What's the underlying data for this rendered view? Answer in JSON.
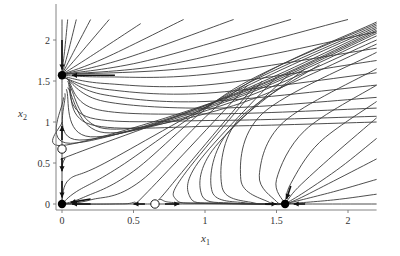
{
  "chart_data": {
    "type": "line",
    "title": "",
    "xlabel": "x1",
    "ylabel": "x2",
    "xlim": [
      0,
      2.2
    ],
    "ylim": [
      0,
      2.25
    ],
    "x_ticks": [
      0,
      0.5,
      1,
      1.5,
      2
    ],
    "x_tick_labels": [
      "0",
      "0.5",
      "1",
      "1.5",
      "2"
    ],
    "y_ticks": [
      0,
      0.5,
      1,
      1.5,
      2
    ],
    "y_tick_labels": [
      "0",
      "0.5",
      "1",
      "1.5",
      "2"
    ],
    "grid": false,
    "equilibria": [
      {
        "x": 0,
        "y": 0,
        "type": "stable",
        "filled": true
      },
      {
        "x": 0,
        "y": 1.57,
        "type": "stable",
        "filled": true
      },
      {
        "x": 0,
        "y": 0.67,
        "type": "unstable",
        "filled": false
      },
      {
        "x": 0.65,
        "y": 0,
        "type": "unstable",
        "filled": false
      },
      {
        "x": 1.56,
        "y": 0,
        "type": "stable",
        "filled": true
      }
    ],
    "arrows": [
      {
        "from": [
          0,
          2.0
        ],
        "to": [
          0,
          1.64
        ]
      },
      {
        "from": [
          0.37,
          1.57
        ],
        "to": [
          0.07,
          1.57
        ]
      },
      {
        "from": [
          0,
          0.78
        ],
        "to": [
          0,
          0.95
        ]
      },
      {
        "from": [
          0,
          0.56
        ],
        "to": [
          0,
          0.4
        ]
      },
      {
        "from": [
          0,
          0.28
        ],
        "to": [
          0,
          0.08
        ]
      },
      {
        "from": [
          0.2,
          0.06
        ],
        "to": [
          0.06,
          0.02
        ]
      },
      {
        "from": [
          0.2,
          0
        ],
        "to": [
          0.07,
          0
        ]
      },
      {
        "from": [
          0.58,
          0
        ],
        "to": [
          0.5,
          0
        ]
      },
      {
        "from": [
          0.72,
          0
        ],
        "to": [
          0.82,
          0
        ]
      },
      {
        "from": [
          1.42,
          0
        ],
        "to": [
          1.5,
          0
        ]
      },
      {
        "from": [
          1.7,
          0
        ],
        "to": [
          1.62,
          0
        ]
      },
      {
        "from": [
          1.6,
          0.22
        ],
        "to": [
          1.57,
          0.06
        ]
      }
    ],
    "trajectories": [
      [
        [
          0.04,
          2.25
        ],
        [
          0.02,
          1.9
        ],
        [
          0.0,
          1.6
        ]
      ],
      [
        [
          0.1,
          2.25
        ],
        [
          0.05,
          1.9
        ],
        [
          0.0,
          1.58
        ]
      ],
      [
        [
          0.2,
          2.25
        ],
        [
          0.08,
          1.85
        ],
        [
          0.0,
          1.58
        ]
      ],
      [
        [
          0.33,
          2.25
        ],
        [
          0.12,
          1.82
        ],
        [
          0.0,
          1.58
        ]
      ],
      [
        [
          0.55,
          2.2
        ],
        [
          0.2,
          1.8
        ],
        [
          0.0,
          1.58
        ]
      ],
      [
        [
          0.85,
          2.25
        ],
        [
          0.3,
          1.78
        ],
        [
          0.0,
          1.58
        ]
      ],
      [
        [
          1.2,
          2.25
        ],
        [
          0.45,
          1.78
        ],
        [
          0.0,
          1.58
        ]
      ],
      [
        [
          1.6,
          2.25
        ],
        [
          0.6,
          1.75
        ],
        [
          0.0,
          1.58
        ]
      ],
      [
        [
          2.0,
          2.25
        ],
        [
          0.8,
          1.72
        ],
        [
          0.0,
          1.58
        ]
      ],
      [
        [
          2.2,
          2.1
        ],
        [
          1.0,
          1.68
        ],
        [
          0.0,
          1.58
        ]
      ],
      [
        [
          2.2,
          1.9
        ],
        [
          1.0,
          1.58
        ],
        [
          0.3,
          1.55
        ],
        [
          0.0,
          1.57
        ]
      ],
      [
        [
          2.2,
          1.75
        ],
        [
          1.0,
          1.45
        ],
        [
          0.3,
          1.47
        ],
        [
          0.0,
          1.56
        ]
      ],
      [
        [
          2.2,
          1.6
        ],
        [
          1.0,
          1.35
        ],
        [
          0.3,
          1.4
        ],
        [
          0.0,
          1.55
        ]
      ],
      [
        [
          2.2,
          1.45
        ],
        [
          1.0,
          1.25
        ],
        [
          0.3,
          1.33
        ],
        [
          0.02,
          1.54
        ]
      ],
      [
        [
          2.2,
          1.3
        ],
        [
          1.1,
          1.17
        ],
        [
          0.3,
          1.25
        ],
        [
          0.03,
          1.53
        ]
      ],
      [
        [
          2.2,
          1.17
        ],
        [
          1.1,
          1.1
        ],
        [
          0.25,
          1.15
        ],
        [
          0.04,
          1.52
        ]
      ],
      [
        [
          2.2,
          1.07
        ],
        [
          1.1,
          1.02
        ],
        [
          0.2,
          1.05
        ],
        [
          0.04,
          1.5
        ]
      ],
      [
        [
          2.2,
          1.0
        ],
        [
          1.1,
          0.95
        ],
        [
          0.2,
          0.97
        ],
        [
          0.05,
          1.48
        ]
      ],
      [
        [
          2.2,
          1.95
        ],
        [
          1.2,
          1.2
        ],
        [
          0.3,
          0.92
        ],
        [
          0.05,
          1.45
        ]
      ],
      [
        [
          2.2,
          2.0
        ],
        [
          1.2,
          1.25
        ],
        [
          0.3,
          0.87
        ],
        [
          0.04,
          1.42
        ]
      ],
      [
        [
          2.2,
          2.05
        ],
        [
          1.2,
          1.28
        ],
        [
          0.2,
          0.82
        ],
        [
          0.03,
          1.4
        ]
      ],
      [
        [
          2.2,
          2.08
        ],
        [
          1.2,
          1.3
        ],
        [
          0.12,
          0.78
        ],
        [
          0.02,
          1.35
        ]
      ],
      [
        [
          2.2,
          2.1
        ],
        [
          1.2,
          1.32
        ],
        [
          0.06,
          0.74
        ],
        [
          0.01,
          1.3
        ]
      ],
      [
        [
          2.2,
          2.12
        ],
        [
          1.2,
          1.33
        ],
        [
          0.03,
          0.72
        ],
        [
          0.0,
          1.0
        ]
      ],
      [
        [
          2.2,
          2.14
        ],
        [
          1.2,
          1.34
        ],
        [
          0.1,
          0.62
        ],
        [
          0.02,
          0.55
        ],
        [
          0.0,
          0.45
        ]
      ],
      [
        [
          2.2,
          2.16
        ],
        [
          1.2,
          1.36
        ],
        [
          0.3,
          0.5
        ],
        [
          0.05,
          0.3
        ],
        [
          0.0,
          0.05
        ]
      ],
      [
        [
          2.2,
          2.18
        ],
        [
          1.2,
          1.38
        ],
        [
          0.4,
          0.45
        ],
        [
          0.1,
          0.15
        ],
        [
          0.0,
          0.0
        ]
      ],
      [
        [
          2.2,
          2.2
        ],
        [
          1.2,
          1.4
        ],
        [
          0.5,
          0.4
        ],
        [
          0.15,
          0.08
        ],
        [
          0.0,
          0.0
        ]
      ],
      [
        [
          2.2,
          2.22
        ],
        [
          1.25,
          1.42
        ],
        [
          0.55,
          0.28
        ],
        [
          0.2,
          0.05
        ],
        [
          0.0,
          0.0
        ]
      ],
      [
        [
          1.3,
          1.45
        ],
        [
          0.6,
          0.15
        ],
        [
          0.5,
          0.02
        ],
        [
          0.35,
          0.0
        ],
        [
          0.0,
          0.0
        ]
      ],
      [
        [
          1.35,
          1.45
        ],
        [
          0.75,
          0.2
        ],
        [
          0.7,
          0.05
        ],
        [
          0.9,
          0.01
        ],
        [
          1.56,
          0.0
        ]
      ],
      [
        [
          1.4,
          1.5
        ],
        [
          0.85,
          0.35
        ],
        [
          0.8,
          0.05
        ],
        [
          1.0,
          0.01
        ],
        [
          1.56,
          0.0
        ]
      ],
      [
        [
          1.5,
          1.55
        ],
        [
          0.95,
          0.5
        ],
        [
          0.9,
          0.07
        ],
        [
          1.1,
          0.01
        ],
        [
          1.56,
          0.0
        ]
      ],
      [
        [
          1.6,
          1.6
        ],
        [
          1.05,
          0.65
        ],
        [
          0.98,
          0.1
        ],
        [
          1.2,
          0.01
        ],
        [
          1.56,
          0.0
        ]
      ],
      [
        [
          1.7,
          1.65
        ],
        [
          1.15,
          0.85
        ],
        [
          1.05,
          0.15
        ],
        [
          1.3,
          0.01
        ],
        [
          1.56,
          0.0
        ]
      ],
      [
        [
          1.8,
          1.7
        ],
        [
          1.22,
          1.0
        ],
        [
          1.12,
          0.2
        ],
        [
          1.35,
          0.01
        ],
        [
          1.56,
          0.0
        ]
      ],
      [
        [
          2.2,
          1.85
        ],
        [
          1.4,
          1.1
        ],
        [
          1.25,
          0.3
        ],
        [
          1.45,
          0.02
        ],
        [
          1.56,
          0.0
        ]
      ],
      [
        [
          2.2,
          1.65
        ],
        [
          1.55,
          1.0
        ],
        [
          1.38,
          0.35
        ],
        [
          1.5,
          0.03
        ],
        [
          1.56,
          0.0
        ]
      ],
      [
        [
          2.2,
          1.45
        ],
        [
          1.7,
          0.9
        ],
        [
          1.5,
          0.3
        ],
        [
          1.56,
          0.0
        ]
      ],
      [
        [
          2.2,
          1.25
        ],
        [
          1.8,
          0.75
        ],
        [
          1.6,
          0.25
        ],
        [
          1.56,
          0.0
        ]
      ],
      [
        [
          2.2,
          1.05
        ],
        [
          1.9,
          0.6
        ],
        [
          1.65,
          0.2
        ],
        [
          1.56,
          0.0
        ]
      ],
      [
        [
          2.2,
          0.8
        ],
        [
          1.95,
          0.45
        ],
        [
          1.7,
          0.15
        ],
        [
          1.56,
          0.0
        ]
      ],
      [
        [
          2.2,
          0.55
        ],
        [
          1.9,
          0.28
        ],
        [
          1.65,
          0.06
        ],
        [
          1.56,
          0.0
        ]
      ],
      [
        [
          2.2,
          0.3
        ],
        [
          1.9,
          0.15
        ],
        [
          1.56,
          0.0
        ]
      ],
      [
        [
          2.2,
          0.12
        ],
        [
          1.9,
          0.05
        ],
        [
          1.56,
          0.0
        ]
      ],
      [
        [
          0.0,
          0.0
        ],
        [
          2.2,
          0.0
        ]
      ],
      [
        [
          0.0,
          0.0
        ],
        [
          0.0,
          2.25
        ]
      ]
    ]
  },
  "axes": {
    "xlabel_main": "x",
    "xlabel_sub": "1",
    "ylabel_main": "x",
    "ylabel_sub": "2"
  }
}
